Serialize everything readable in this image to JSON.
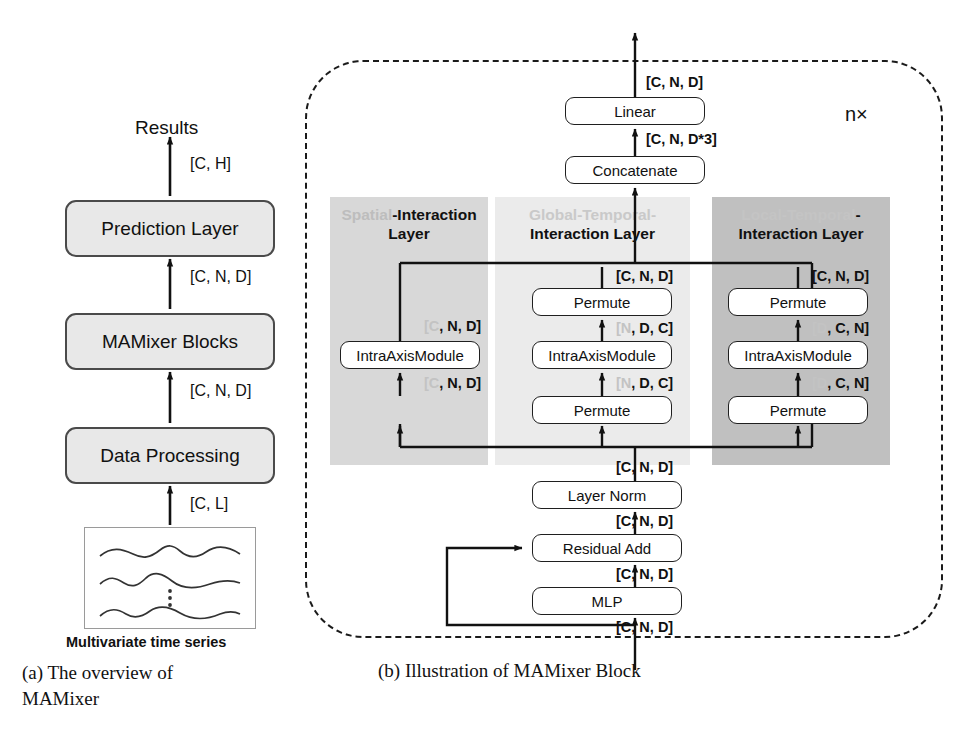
{
  "figure": {
    "caption_a": "(a)  The   overview   of MAMixer",
    "caption_b": "(b) Illustration of MAMixer Block"
  },
  "overview": {
    "output_label": "Results",
    "blocks": [
      {
        "label": "Prediction Layer"
      },
      {
        "label": "MAMixer Blocks"
      },
      {
        "label": "Data Processing"
      }
    ],
    "edge_labels": {
      "to_results": "[C, H]",
      "prediction_in": "[C, N, D]",
      "mamixer_in": "[C, N, D]",
      "dataproc_in": "[C, L]"
    },
    "input_caption": "Multivariate time series"
  },
  "mamixer_block": {
    "repeat_label": "n×",
    "top_out_tag": "[C, N, D]",
    "linear": "Linear",
    "concat_in_tag": "[C, N, D*3]",
    "concatenate": "Concatenate",
    "layer_norm": "Layer Norm",
    "residual_add": "Residual Add",
    "mlp": "MLP",
    "ln_out_tag": "[C, N, D]",
    "ln_in_tag": "[C, N, D]",
    "res_in_tag": "[C, N, D]",
    "mlp_in_tag": "[C, N, D]",
    "columns": [
      {
        "id": "spatial",
        "title_faint": "Spatial",
        "title_bold": "-Interaction Layer",
        "blocks": [
          "IntraAxisModule"
        ],
        "tag_top": "[C, N, D]",
        "tag_bottom": "[C, N, D]",
        "tag_faint_char": "C"
      },
      {
        "id": "global-temporal",
        "title_faint": "Global-Temporal-",
        "title_bold": "Interaction Layer",
        "blocks": [
          "Permute",
          "IntraAxisModule",
          "Permute"
        ],
        "tag_out": "[C, N, D]",
        "tag_top": "[N, D, C]",
        "tag_bottom": "[N, D, C]",
        "tag_faint_char": "N"
      },
      {
        "id": "local-temporal",
        "title_faint": "Local-Temporal",
        "title_bold": "-",
        "title_bold2": "Interaction Layer",
        "blocks": [
          "Permute",
          "IntraAxisModule",
          "Permute"
        ],
        "tag_out": "[C, N, D]",
        "tag_top": "[D, C, N]",
        "tag_bottom": "[D, C, N]",
        "tag_faint_char": "D"
      }
    ]
  }
}
